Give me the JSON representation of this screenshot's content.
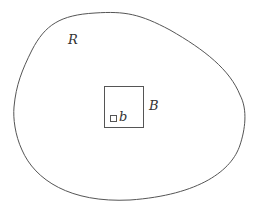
{
  "diagram": {
    "region_label": "R",
    "big_box_label": "B",
    "small_box_label": "b",
    "stroke_color": "#555555",
    "background": "#ffffff"
  }
}
